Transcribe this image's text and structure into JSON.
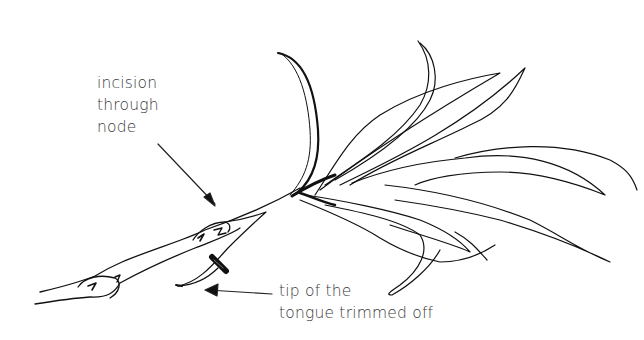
{
  "figure": {
    "labels": {
      "incision": [
        "incision",
        "through",
        "node"
      ],
      "tip": [
        "tip of the",
        "tongue trimmed off"
      ]
    },
    "colors": {
      "ink": "#111111",
      "text": "#3a3a3a",
      "background": "#ffffff"
    }
  }
}
